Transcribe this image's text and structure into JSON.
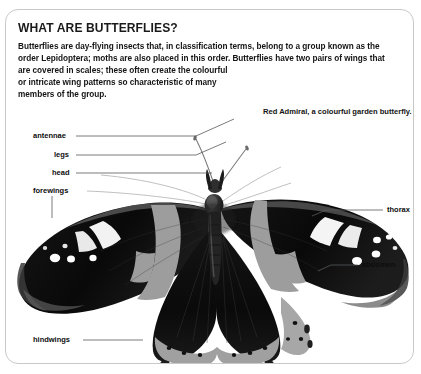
{
  "document": {
    "heading": "WHAT ARE BUTTERFLIES?",
    "body_lines": [
      "Butterflies are day-flying insects that, in classification terms, belong to a group known as the",
      "order Lepidoptera; moths are also placed in this order. Butterflies have two pairs of wings that",
      "are covered in scales; these often create the colourful",
      "or intricate wing patterns so characteristic of many",
      "members of the group."
    ],
    "caption": "Red Admiral, a colourful garden butterfly.",
    "figure": {
      "subject": "red-admiral-butterfly-photograph",
      "callouts_left": [
        {
          "label": "antennae",
          "text_x": 33,
          "text_y": 132,
          "line_x1": 76,
          "line_y1": 136,
          "line_x2": 196,
          "line_y2": 136,
          "line_x3": 232,
          "line_y3": 120
        },
        {
          "label": "legs",
          "text_x": 54,
          "text_y": 151,
          "line_x1": 76,
          "line_y1": 155,
          "line_x2": 196,
          "line_y2": 155,
          "line_x3": 225,
          "line_y3": 143
        },
        {
          "label": "head",
          "text_x": 52,
          "text_y": 169,
          "line_x1": 76,
          "line_y1": 173,
          "line_x2": 205,
          "line_y2": 173,
          "line_x3": 212,
          "line_y3": 172
        },
        {
          "label": "forewings",
          "text_x": 33,
          "text_y": 187,
          "line_x1": 52,
          "line_y1": 195,
          "line_x2": 52,
          "line_y2": 215,
          "line_x3": 52,
          "line_y3": 215
        },
        {
          "label": "hindwings",
          "text_x": 33,
          "text_y": 336,
          "line_x1": 83,
          "line_y1": 340,
          "line_x2": 142,
          "line_y2": 340,
          "line_x3": 142,
          "line_y3": 340
        }
      ],
      "callouts_right": [
        {
          "label": "thorax",
          "text_x": 386,
          "text_y": 206,
          "line_x1": 383,
          "line_y1": 210,
          "line_x2": 326,
          "line_y2": 210,
          "line_x3": 314,
          "line_y3": 215
        },
        {
          "label": "abdomen",
          "text_x": 361,
          "text_y": 261,
          "line_x1": 358,
          "line_y1": 265,
          "line_x2": 330,
          "line_y2": 265,
          "line_x3": 318,
          "line_y3": 270
        }
      ]
    }
  },
  "colors": {
    "page_background": "#ffffff",
    "panel_border": "#c9c9c9",
    "text": "#141414",
    "heading_text": "#1a1a1a",
    "leader_line": "#4a4a4a",
    "wing_dark": "#0d0d0d",
    "wing_band": "#9a9a9a",
    "wing_spot": "#ffffff"
  }
}
